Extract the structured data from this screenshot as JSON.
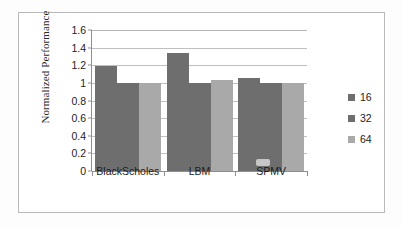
{
  "chart_data": {
    "type": "bar",
    "title": "",
    "subtitle": "",
    "xlabel": "",
    "ylabel": "Normalized Performance",
    "categories": [
      "BlackScholes",
      "LBM",
      "SPMV"
    ],
    "series": [
      {
        "name": "16",
        "values": [
          1.19,
          1.34,
          1.06
        ],
        "color": "#6e6e6e"
      },
      {
        "name": "32",
        "values": [
          1.0,
          1.0,
          1.0
        ],
        "color": "#6e6e6e"
      },
      {
        "name": "64",
        "values": [
          1.0,
          1.03,
          1.0
        ],
        "color": "#a9a9a9"
      }
    ],
    "ylim": [
      0,
      1.6
    ],
    "ytick_step": 0.2,
    "ytick_labels": [
      "0",
      "0.2",
      "0.4",
      "0.6",
      "0.8",
      "1",
      "1.2",
      "1.4",
      "1.6"
    ],
    "ytick_values": [
      0,
      0.2,
      0.4,
      0.6,
      0.8,
      1.0,
      1.2,
      1.4,
      1.6
    ],
    "grid": true,
    "grid_axis": "y",
    "legend_position": "right",
    "legend_entries": [
      "16",
      "32",
      "64"
    ]
  },
  "figure": {
    "border_color": "#b9b9b9",
    "background": "#ffffff",
    "gridline_color": "#c0c0c0",
    "axis_color": "#8f8f8f",
    "text_color": "#1d1d1d"
  }
}
